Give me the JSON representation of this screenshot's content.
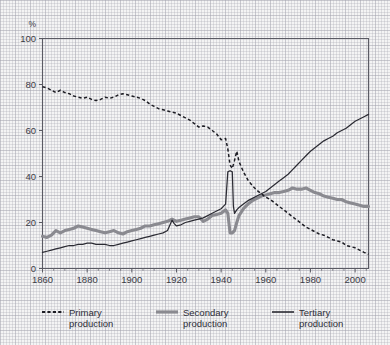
{
  "chart_data": {
    "type": "line",
    "title": "",
    "subtitle": "",
    "xlabel": "",
    "ylabel": "%",
    "y_unit_label": "%",
    "xlim": [
      1860,
      2006
    ],
    "ylim": [
      0,
      100
    ],
    "grid": true,
    "grid_style": "graph-paper",
    "legend_position": "below-plot",
    "x_ticks": [
      1860,
      1880,
      1900,
      1920,
      1940,
      1960,
      1980,
      2000
    ],
    "x_tick_labels": [
      "1860",
      "1880",
      "1900",
      "1920",
      "1940",
      "1960",
      "1980",
      "2000"
    ],
    "x_minor_tick_step": 5,
    "y_ticks": [
      0,
      20,
      40,
      60,
      80,
      100
    ],
    "y_tick_labels": [
      "0",
      "20",
      "40",
      "60",
      "80",
      "100"
    ],
    "series": [
      {
        "name": "Primary production",
        "legend_label_line1": "Primary",
        "legend_label_line2": "production",
        "style": "dashed",
        "color": "#1d1d24",
        "x": [
          1860,
          1862,
          1864,
          1866,
          1868,
          1870,
          1872,
          1874,
          1876,
          1878,
          1880,
          1882,
          1884,
          1886,
          1888,
          1890,
          1892,
          1894,
          1896,
          1898,
          1900,
          1902,
          1904,
          1906,
          1908,
          1910,
          1912,
          1914,
          1916,
          1918,
          1920,
          1922,
          1924,
          1926,
          1928,
          1930,
          1932,
          1934,
          1936,
          1938,
          1940,
          1942,
          1943,
          1944,
          1945,
          1946,
          1947,
          1948,
          1950,
          1952,
          1954,
          1956,
          1958,
          1960,
          1962,
          1964,
          1966,
          1968,
          1970,
          1972,
          1974,
          1976,
          1978,
          1980,
          1982,
          1984,
          1986,
          1988,
          1990,
          1992,
          1994,
          1996,
          1998,
          2000,
          2002,
          2004,
          2006
        ],
        "y": [
          79,
          78.5,
          77.5,
          76.5,
          77.5,
          76.5,
          76,
          75,
          74.5,
          74,
          74.5,
          73.5,
          73,
          73.5,
          74.5,
          74,
          74.5,
          75.5,
          76,
          75.5,
          75,
          74.5,
          74,
          73,
          71.5,
          70.5,
          69.5,
          69,
          68.5,
          68,
          67.5,
          66.5,
          65.5,
          64.5,
          63,
          61.5,
          62,
          61.5,
          60,
          58.5,
          56,
          56.5,
          52,
          45,
          43.5,
          47,
          51,
          46.5,
          42,
          38.5,
          36,
          34,
          32.5,
          31,
          30,
          28.5,
          27,
          25.5,
          24,
          22.5,
          21,
          19.5,
          18,
          17,
          16,
          15,
          14.5,
          13.5,
          12.5,
          12,
          11.5,
          10,
          9.5,
          9,
          8,
          7,
          6.2
        ]
      },
      {
        "name": "Secondary production",
        "legend_label_line1": "Secondary",
        "legend_label_line2": "production",
        "style": "solid-thick",
        "color": "#8a8a90",
        "x": [
          1860,
          1862,
          1864,
          1866,
          1868,
          1870,
          1872,
          1874,
          1876,
          1878,
          1880,
          1882,
          1884,
          1886,
          1888,
          1890,
          1892,
          1894,
          1896,
          1898,
          1900,
          1902,
          1904,
          1906,
          1908,
          1910,
          1912,
          1914,
          1916,
          1918,
          1920,
          1922,
          1924,
          1926,
          1928,
          1930,
          1932,
          1934,
          1936,
          1938,
          1940,
          1942,
          1943,
          1944,
          1945,
          1946,
          1947,
          1948,
          1950,
          1952,
          1954,
          1956,
          1958,
          1960,
          1962,
          1964,
          1966,
          1968,
          1970,
          1972,
          1974,
          1976,
          1978,
          1980,
          1982,
          1984,
          1986,
          1988,
          1990,
          1992,
          1994,
          1996,
          1998,
          2000,
          2002,
          2004,
          2006
        ],
        "y": [
          14,
          13.5,
          14.5,
          16.5,
          15.5,
          16.5,
          17,
          17.5,
          18.5,
          18,
          17.5,
          17,
          16.5,
          16,
          15.5,
          16,
          16.5,
          15.5,
          15,
          16,
          16.5,
          17,
          17.5,
          18.5,
          18.5,
          19,
          19.5,
          20,
          20.5,
          21.5,
          20.5,
          21,
          21.5,
          22,
          22.5,
          22.5,
          20.5,
          21.5,
          23,
          23.5,
          24,
          25.5,
          24,
          15.5,
          15.5,
          16.5,
          20,
          23,
          26,
          28,
          29.5,
          30.5,
          31.5,
          32,
          32.5,
          33,
          33,
          33.5,
          34,
          35,
          34.5,
          34.5,
          35,
          34,
          33,
          32.5,
          31.5,
          31,
          30.5,
          30,
          30,
          29,
          28.5,
          28,
          27.5,
          27,
          27
        ]
      },
      {
        "name": "Tertiary production",
        "legend_label_line1": "Tertiary",
        "legend_label_line2": "production",
        "style": "solid-thin",
        "color": "#2b2b33",
        "x": [
          1860,
          1862,
          1864,
          1866,
          1868,
          1870,
          1872,
          1874,
          1876,
          1878,
          1880,
          1882,
          1884,
          1886,
          1888,
          1890,
          1892,
          1894,
          1896,
          1898,
          1900,
          1902,
          1904,
          1906,
          1908,
          1910,
          1912,
          1914,
          1916,
          1918,
          1919,
          1920,
          1922,
          1924,
          1926,
          1928,
          1930,
          1932,
          1934,
          1936,
          1938,
          1940,
          1941,
          1942,
          1943,
          1944,
          1945,
          1945.5,
          1946,
          1947,
          1948,
          1950,
          1952,
          1954,
          1956,
          1958,
          1960,
          1962,
          1964,
          1966,
          1968,
          1970,
          1972,
          1974,
          1976,
          1978,
          1980,
          1982,
          1984,
          1986,
          1988,
          1990,
          1992,
          1994,
          1996,
          1998,
          2000,
          2002,
          2004,
          2006
        ],
        "y": [
          7,
          7.5,
          8,
          8.5,
          9,
          9.5,
          10,
          10,
          10.5,
          10.5,
          11,
          11,
          10.5,
          10.5,
          10.5,
          10,
          10,
          10.5,
          11,
          11.5,
          12,
          12.5,
          13,
          13.5,
          14,
          14.5,
          15,
          15.5,
          16.5,
          21,
          19.5,
          18.5,
          19,
          20,
          20.5,
          21,
          21.5,
          22,
          23,
          24,
          25,
          26,
          27,
          28,
          42,
          42.5,
          42,
          27,
          24,
          25.5,
          26.5,
          28,
          29.5,
          30.5,
          31.5,
          32.5,
          33.5,
          35,
          36.5,
          38,
          39.5,
          41,
          43,
          45,
          47,
          49,
          51,
          52.5,
          54,
          55.5,
          56.5,
          57.5,
          59,
          60,
          61,
          62.5,
          64,
          65,
          66,
          67
        ]
      }
    ],
    "annotations": {
      "tertiary_wartime_spike": "Tertiary series shows a sharp spike to ~42% around 1943-1945 then drops back to ~24% by 1946",
      "secondary_wartime_dip": "Secondary series dips to ~15.5% around 1944-1945",
      "primary_wartime_bump": "Primary series rebounds to ~51% around 1947 before resuming decline"
    }
  },
  "legend": {
    "entries": [
      {
        "label_line1": "Primary",
        "label_line2": "production",
        "swatch": "dashed-line-swatch"
      },
      {
        "label_line1": "Secondary",
        "label_line2": "production",
        "swatch": "thick-line-swatch"
      },
      {
        "label_line1": "Tertiary",
        "label_line2": "production",
        "swatch": "thin-line-swatch"
      }
    ]
  },
  "colors": {
    "primary_series": "#1d1d24",
    "secondary_series": "#8a8a90",
    "tertiary_series": "#2b2b33",
    "axis": "#5a5a63",
    "text": "#3b3b45",
    "background": "#f4f4f4",
    "grid_minor": "#aaaab4",
    "grid_major": "#9696a2"
  }
}
